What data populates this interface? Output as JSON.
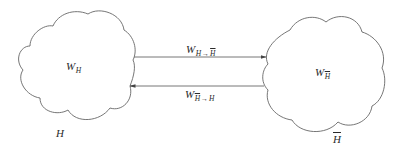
{
  "diagram": {
    "type": "state-transition",
    "colors": {
      "stroke": "#666666",
      "text": "#2a2a2a",
      "background": "#ffffff"
    },
    "nodes": [
      {
        "id": "H",
        "name_label": "H",
        "weight_label": {
          "main": "W",
          "subscript": "H"
        }
      },
      {
        "id": "H_bar",
        "name_label": "H",
        "name_overline": true,
        "weight_label": {
          "main": "W",
          "subscript": "H",
          "subscript_overline": true
        }
      }
    ],
    "edges": [
      {
        "from": "H",
        "to": "H_bar",
        "label": {
          "main": "W",
          "sub_from": "H",
          "arrow": "→",
          "sub_to": "H",
          "sub_to_overline": true
        }
      },
      {
        "from": "H_bar",
        "to": "H",
        "label": {
          "main": "W",
          "sub_from": "H",
          "sub_from_overline": true,
          "arrow": "→",
          "sub_to": "H"
        }
      }
    ]
  }
}
